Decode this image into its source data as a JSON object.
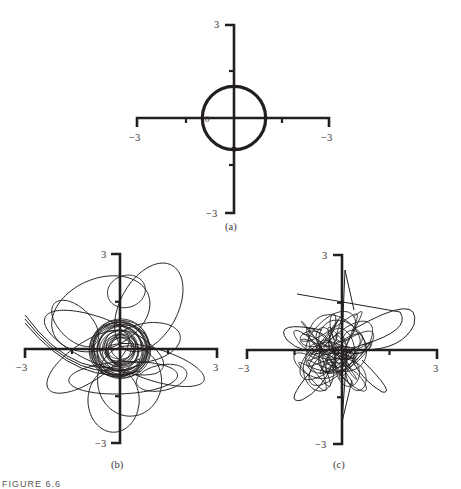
{
  "figure": {
    "caption": "FIGURE 6.6",
    "colors": {
      "ink": "#231f20",
      "label": "#3a3536",
      "background": "#ffffff"
    }
  },
  "chart_data": [
    {
      "id": "a",
      "type": "line",
      "title": "(a)",
      "xlabel": "",
      "ylabel": "",
      "xlim": [
        -3,
        3
      ],
      "ylim": [
        -3,
        3
      ],
      "x_tick_labels": {
        "left": "−3",
        "right": "−3"
      },
      "y_tick_labels": {
        "top": "3",
        "bottom": "−3"
      },
      "origin_label": "0",
      "minor_ticks": [
        -1.5,
        1.5
      ],
      "grid": false,
      "description": "Periodic orbit: unit circle centered at origin",
      "series": [
        {
          "name": "orbit",
          "shape": "circle",
          "center": [
            0,
            0
          ],
          "radius": 1.0
        }
      ],
      "layout": {
        "cx": 234,
        "cy": 118,
        "x_left": 137,
        "x_right": 329,
        "y_top": 25,
        "y_bottom": 213,
        "label_y": 226
      }
    },
    {
      "id": "b",
      "type": "line",
      "title": "(b)",
      "xlabel": "",
      "ylabel": "",
      "xlim": [
        -3,
        3
      ],
      "ylim": [
        -3,
        3
      ],
      "x_tick_labels": {
        "left": "−3",
        "right": "3"
      },
      "y_tick_labels": {
        "top": "3",
        "bottom": "−3"
      },
      "minor_ticks": [
        1.5,
        -1.5
      ],
      "grid": false,
      "description": "Perturbed orbit: dense winding around unit circle with large excursions (up to ~2.5 units)",
      "series": [
        {
          "name": "trajectory",
          "dense_core_radius": 0.9,
          "max_excursion": 2.6
        }
      ],
      "layout": {
        "cx": 120,
        "cy": 349,
        "x_left": 25,
        "x_right": 217,
        "y_top": 254,
        "y_bottom": 443,
        "label_y": 466
      }
    },
    {
      "id": "c",
      "type": "line",
      "title": "(c)",
      "xlabel": "",
      "ylabel": "",
      "xlim": [
        -3,
        3
      ],
      "ylim": [
        -3,
        3
      ],
      "x_tick_labels": {
        "left": "−3",
        "right": "3"
      },
      "y_tick_labels": {
        "top": "3",
        "bottom": "−3"
      },
      "minor_ticks": [
        1.5,
        -1.5
      ],
      "grid": false,
      "description": "Chaotic trajectory filling region around origin, extents roughly ±1.5 with spikes to ~2.5",
      "series": [
        {
          "name": "trajectory",
          "core_radius": 1.2,
          "max_excursion": 2.5
        }
      ],
      "layout": {
        "cx": 342,
        "cy": 350,
        "x_left": 247,
        "x_right": 437,
        "y_top": 255,
        "y_bottom": 444,
        "label_y": 466
      }
    }
  ]
}
